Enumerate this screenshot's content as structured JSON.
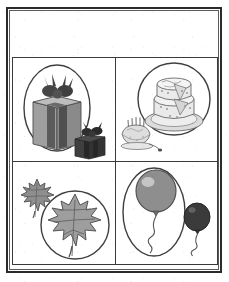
{
  "worksheet": {
    "title": "Big and Small Picture Grid",
    "layout": "2x2 grid worksheet, bordered page, blank heading band at top",
    "border_color": "#2b2b2b",
    "grid_line_color": "#3a3a3a",
    "page_background": "#ffffff",
    "rows": 2,
    "columns": 2,
    "header_band_label": ""
  },
  "palette": {
    "ink": "#3a3a3a",
    "outline": "#4a4a4a",
    "light_gray": "#d8d8d8",
    "mid_gray": "#9a9a9a",
    "mid_dark_gray": "#7b7b7b",
    "dark_gray": "#565656",
    "charcoal": "#3d3d3d",
    "near_black": "#2f2f2f",
    "highlight": "#efefef",
    "cream": "#e9e9e9"
  },
  "cells": [
    {
      "position": "top-left",
      "theme": "gifts",
      "enclosure_shape": "oval",
      "enclosed_item": {
        "name": "large-gift-box",
        "label": "Large gift box with bow",
        "size": "large",
        "fill": "#9a9a9a",
        "ribbon_fill": "#565656",
        "bow_fill": "#4a4a4a"
      },
      "outside_item": {
        "name": "small-gift-box",
        "label": "Small gift box with bow",
        "size": "small",
        "fill": "#3d3d3d",
        "ribbon_fill": "#2f2f2f",
        "bow_fill": "#2f2f2f"
      }
    },
    {
      "position": "top-right",
      "theme": "cakes",
      "enclosure_shape": "circle",
      "enclosed_item": {
        "name": "large-layer-cake",
        "label": "Large two-layer cake on plate with slice cut",
        "size": "large",
        "fill": "#e9e9e9",
        "plate_fill": "#d8d8d8",
        "outline": "#6a6a6a"
      },
      "outside_item": {
        "name": "small-birthday-cake",
        "label": "Small birthday cake with candles",
        "size": "small",
        "fill": "#dcdcdc",
        "candle_color": "#5a5a5a",
        "outline": "#6a6a6a"
      }
    },
    {
      "position": "bottom-left",
      "theme": "leaves",
      "enclosure_shape": "circle",
      "enclosed_item": {
        "name": "large-maple-leaf",
        "label": "Large maple leaf",
        "size": "large",
        "fill": "#9e9e9e",
        "vein_color": "#666666",
        "outline": "#545454"
      },
      "outside_item": {
        "name": "small-maple-leaf",
        "label": "Small maple leaf",
        "size": "small",
        "fill": "#8e8e8e",
        "vein_color": "#5e5e5e",
        "outline": "#4f4f4f"
      }
    },
    {
      "position": "bottom-right",
      "theme": "balloons",
      "enclosure_shape": "oval",
      "enclosed_item": {
        "name": "large-balloon",
        "label": "Large balloon with curly string",
        "size": "large",
        "fill": "#8e8e8e",
        "highlight": "#cfcfcf",
        "string_color": "#555555"
      },
      "outside_item": {
        "name": "small-balloon",
        "label": "Small balloon with curly string",
        "size": "small",
        "fill": "#3b3b3b",
        "highlight": "#6e6e6e",
        "string_color": "#555555"
      }
    }
  ]
}
